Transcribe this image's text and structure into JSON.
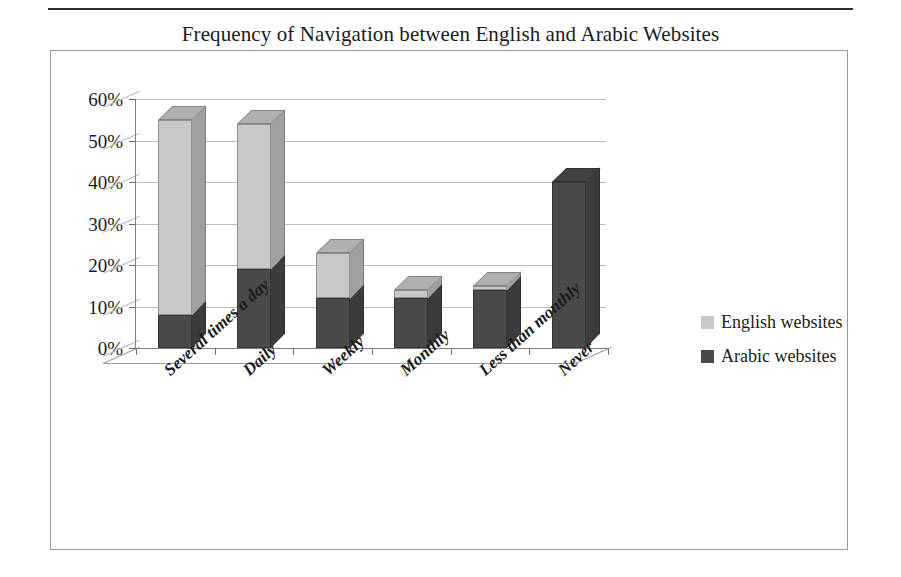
{
  "chart_data": {
    "type": "bar",
    "subtype": "stacked-3d-column",
    "title": "Frequency of Navigation between English and Arabic Websites",
    "xlabel": "",
    "ylabel": "",
    "ylim": [
      0,
      60
    ],
    "ytick_labels": [
      "60%",
      "50%",
      "40%",
      "30%",
      "20%",
      "10%",
      "0%"
    ],
    "ytick_values": [
      60,
      50,
      40,
      30,
      20,
      10,
      0
    ],
    "grid": true,
    "legend_position": "right",
    "categories": [
      "Several times a day",
      "Daily",
      "Weekly",
      "Monthly",
      "Less than monthly",
      "Never"
    ],
    "series": [
      {
        "name": "Arabic websites",
        "color": "#4a4a4a",
        "values": [
          8,
          19,
          12,
          12,
          14,
          40
        ]
      },
      {
        "name": "English websites",
        "color": "#c8c8c8",
        "values": [
          47,
          35,
          11,
          2,
          1,
          0
        ]
      }
    ],
    "stack_order": [
      "Arabic websites",
      "English websites"
    ],
    "totals": [
      55,
      54,
      23,
      14,
      15,
      40
    ]
  },
  "legend": {
    "items": [
      {
        "label": "English websites",
        "color": "#c8c8c8"
      },
      {
        "label": "Arabic websites",
        "color": "#4a4a4a"
      }
    ]
  },
  "colors": {
    "light_gray": "#c8c8c8",
    "dark_gray": "#4a4a4a",
    "gridline": "#b9b9b9",
    "axis": "#7f7f7f",
    "frame": "#9a9a9a",
    "text": "#1b1b1b"
  }
}
